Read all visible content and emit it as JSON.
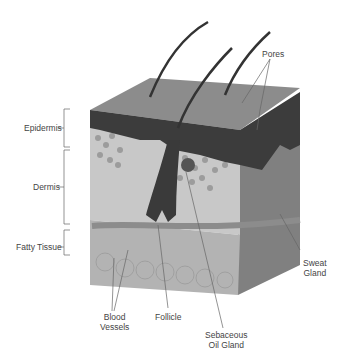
{
  "diagram": {
    "layers": [
      {
        "label": "Epidermis"
      },
      {
        "label": "Dermis"
      },
      {
        "label": "Fatty Tissue"
      }
    ],
    "structures": {
      "pores": "Pores",
      "sweat_gland_1": "Sweat",
      "sweat_gland_2": "Gland",
      "blood_vessels_1": "Blood",
      "blood_vessels_2": "Vessels",
      "follicle": "Follicle",
      "oil_gland_1": "Sebaceous",
      "oil_gland_2": "Oil Gland"
    },
    "colors": {
      "surface": "#8a8a8a",
      "epidermis": "#3a3a3a",
      "dermis": "#c4c4c4",
      "cells": "#9a9a9a",
      "fat": "#b5b5b5",
      "side": "#7a7a7a",
      "line": "#555555"
    }
  }
}
